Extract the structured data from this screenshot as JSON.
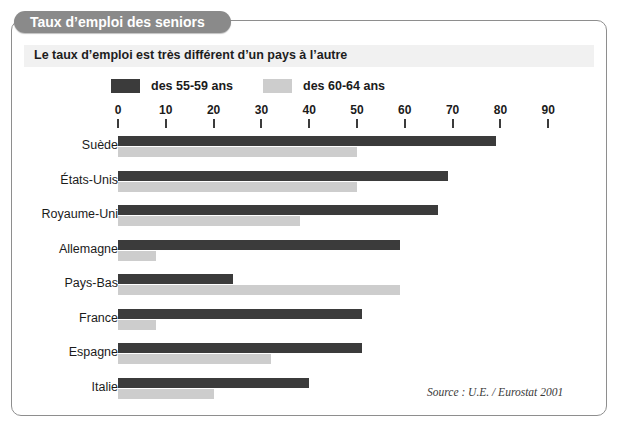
{
  "top_strip_text": "  ",
  "header": {
    "title": "Taux d’emploi des seniors",
    "subtitle": "Le taux d’emploi est très différent d’un pays à l’autre"
  },
  "source_note": "Source : U.E. / Eurostat 2001",
  "colors": {
    "series_55_59": "#3b3b3b",
    "series_60_64": "#cdcdcd",
    "title_pill": "#8a8a8a",
    "subtitle_band": "#f1f1f1",
    "panel_border": "#8e8e8e",
    "text": "#1b1b1b"
  },
  "chart_data": {
    "type": "bar",
    "orientation": "horizontal",
    "title": "Taux d’emploi des seniors",
    "subtitle": "Le taux d’emploi est très différent d’un pays à l’autre",
    "xlabel": "",
    "ylabel": "",
    "xlim": [
      0,
      90
    ],
    "xticks": [
      0,
      10,
      20,
      30,
      40,
      50,
      60,
      70,
      80,
      90
    ],
    "xtick_labels": [
      "0",
      "10",
      "20",
      "30",
      "40",
      "50",
      "60",
      "70",
      "80",
      "90"
    ],
    "grid": false,
    "legend_position": "top",
    "categories": [
      "Suède",
      "États-Unis",
      "Royaume-Uni",
      "Allemagne",
      "Pays-Bas",
      "France",
      "Espagne",
      "Italie"
    ],
    "series": [
      {
        "name": "des 55-59 ans",
        "color": "#3b3b3b",
        "values": [
          79,
          69,
          67,
          59,
          24,
          51,
          51,
          40
        ]
      },
      {
        "name": "des 60-64 ans",
        "color": "#cdcdcd",
        "values": [
          50,
          50,
          38,
          8,
          59,
          8,
          32,
          20
        ]
      }
    ],
    "annotations": [
      "Source : U.E. / Eurostat 2001"
    ]
  },
  "axis_geometry": {
    "x0_px": 106,
    "px_per_unit": 4.78,
    "row_top_px": 113,
    "row_step_px": 34.5
  }
}
